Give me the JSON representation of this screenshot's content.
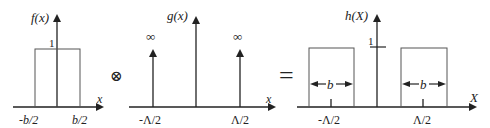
{
  "panel_f": {
    "ylabel": "f(x)",
    "xlabel": "x",
    "height_label": "1",
    "left_tick": "-b/2",
    "right_tick": "b/2"
  },
  "operator_convolve": "⊗",
  "panel_g": {
    "ylabel": "g(x)",
    "xlabel": "x",
    "left_inf": "∞",
    "right_inf": "∞",
    "left_tick": "-Λ/2",
    "right_tick": "Λ/2"
  },
  "operator_equals": "=",
  "panel_h": {
    "ylabel": "h(X)",
    "xlabel": "X",
    "height_label": "1",
    "left_width": "b",
    "right_width": "b",
    "left_tick": "-Λ/2",
    "right_tick": "Λ/2"
  },
  "colors": {
    "stroke": "#222222",
    "rect_stroke": "#555555"
  }
}
